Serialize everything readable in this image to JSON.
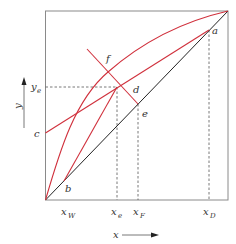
{
  "diagram": {
    "type": "McCabe-Thiele distillation diagram",
    "colors": {
      "curve": "#d0303c",
      "diagonal": "#222222",
      "frame": "#888888",
      "dashed": "#555555",
      "text": "#333333"
    },
    "axes": {
      "x_label": "x",
      "y_label": "y"
    },
    "points": {
      "a": "a",
      "b": "b",
      "c": "c",
      "d": "d",
      "e": "e",
      "f": "f"
    },
    "ticks": {
      "x_W": {
        "main": "x",
        "sub": "W"
      },
      "x_e": {
        "main": "x",
        "sub": "e"
      },
      "x_F": {
        "main": "x",
        "sub": "F"
      },
      "x_D": {
        "main": "x",
        "sub": "D"
      },
      "y_e": {
        "main": "y",
        "sub": "e"
      }
    }
  }
}
